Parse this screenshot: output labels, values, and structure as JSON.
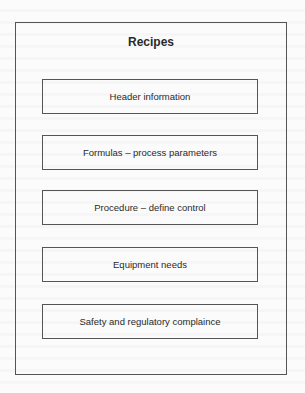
{
  "diagram": {
    "title": "Recipes",
    "boxes": [
      {
        "label": "Header information"
      },
      {
        "label": "Formulas – process parameters"
      },
      {
        "label": "Procedure – define control"
      },
      {
        "label": "Equipment needs"
      },
      {
        "label": "Safety and regulatory complaince"
      }
    ]
  },
  "colors": {
    "stroke": "#555555",
    "text": "#2a2a2a",
    "background": "#fbfbfb"
  }
}
